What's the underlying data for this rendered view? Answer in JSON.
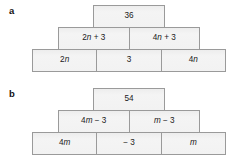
{
  "diagram": {
    "type": "algebra-pyramid-worksheet",
    "parts": [
      {
        "label": "a",
        "rows": [
          {
            "cells": [
              {
                "text": "36"
              }
            ]
          },
          {
            "cells": [
              {
                "text": "2n + 3"
              },
              {
                "text": "4n + 3"
              }
            ]
          },
          {
            "cells": [
              {
                "text": "2n"
              },
              {
                "text": "3"
              },
              {
                "text": "4n"
              }
            ]
          }
        ]
      },
      {
        "label": "b",
        "rows": [
          {
            "cells": [
              {
                "text": "54"
              }
            ]
          },
          {
            "cells": [
              {
                "text": "4m − 3"
              },
              {
                "text": "m − 3"
              }
            ]
          },
          {
            "cells": [
              {
                "text": "4m"
              },
              {
                "text": "− 3"
              },
              {
                "text": "m"
              }
            ]
          }
        ]
      }
    ]
  },
  "pyramid_a": {
    "label": "a",
    "top": "36",
    "middle_left": "2n + 3",
    "middle_right": "4n + 3",
    "bottom_left": "2n",
    "bottom_middle": "3",
    "bottom_right": "4n"
  },
  "pyramid_b": {
    "label": "b",
    "top": "54",
    "middle_left": "4m − 3",
    "middle_right": "m − 3",
    "bottom_left": "4m",
    "bottom_middle": "− 3",
    "bottom_right": "m"
  },
  "colors": {
    "cell_fill": "#f2f2f2",
    "cell_border": "#9a9a9a",
    "text": "#1a1a1a",
    "background": "#ffffff"
  }
}
